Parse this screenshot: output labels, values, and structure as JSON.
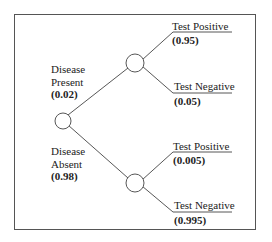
{
  "diagram": {
    "type": "probability-tree",
    "root": {
      "branches": [
        {
          "label_line1": "Disease",
          "label_line2": "Present",
          "probability": "(0.02)",
          "children": [
            {
              "label": "Test Positive",
              "probability": "(0.95)"
            },
            {
              "label": "Test Negative",
              "probability": "(0.05)"
            }
          ]
        },
        {
          "label_line1": "Disease",
          "label_line2": "Absent",
          "probability": "(0.98)",
          "children": [
            {
              "label": "Test Positive",
              "probability": "(0.005)"
            },
            {
              "label": "Test Negative",
              "probability": "(0.995)"
            }
          ]
        }
      ]
    },
    "colors": {
      "line": "#444444",
      "text": "#222222",
      "border": "#555555"
    }
  }
}
